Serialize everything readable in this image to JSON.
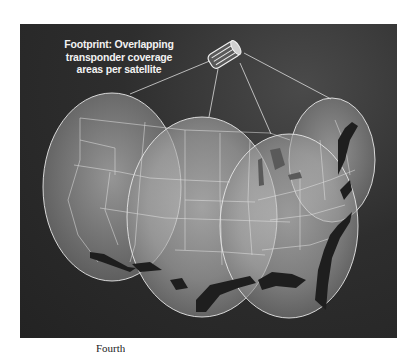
{
  "figure": {
    "caption_lines": [
      "Footprint: Overlapping",
      "transponder coverage",
      "areas per satellite"
    ],
    "below_text_fragment": "Fourth",
    "colors": {
      "background": "#2a2a2a",
      "footprint_center": "#cfcfcf",
      "footprint_edge": "#6e6e6e",
      "outline": "#e6e6e6",
      "water": "#1c1c1c"
    },
    "satellite": {
      "label": "satellite",
      "x": 224,
      "y": 53
    },
    "footprints": [
      {
        "name": "west",
        "cx": 112,
        "cy": 187,
        "rx": 69,
        "ry": 94
      },
      {
        "name": "central",
        "cx": 202,
        "cy": 217,
        "rx": 75,
        "ry": 100
      },
      {
        "name": "southeast",
        "cx": 289,
        "cy": 226,
        "rx": 69,
        "ry": 92
      },
      {
        "name": "northeast",
        "cx": 332,
        "cy": 160,
        "rx": 43,
        "ry": 62
      }
    ]
  }
}
